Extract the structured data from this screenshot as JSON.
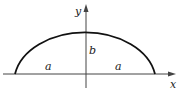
{
  "diagram": {
    "type": "half-ellipse",
    "labels": {
      "y_axis": "y",
      "x_axis": "x",
      "semi_minor": "b",
      "semi_major_left": "a",
      "semi_major_right": "a"
    },
    "colors": {
      "curve": "#111111",
      "axes": "#444444",
      "background": "#ffffff"
    }
  }
}
